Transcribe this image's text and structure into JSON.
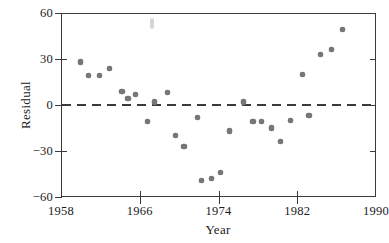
{
  "chart_data": {
    "type": "scatter",
    "title": "",
    "xlabel": "Year",
    "ylabel": "Residual",
    "xlim": [
      1958,
      1990
    ],
    "ylim": [
      -60,
      60
    ],
    "xticks": [
      1958,
      1966,
      1974,
      1982,
      1990
    ],
    "xtick_labels": [
      "1958",
      "1966",
      "1974",
      "1982",
      "1990"
    ],
    "yticks": [
      60,
      30,
      0,
      -30,
      -60
    ],
    "ytick_labels": [
      "60",
      "30",
      "0",
      "−30",
      "−60"
    ],
    "grid": false,
    "legend": null,
    "marker": "filled-circle",
    "marker_color": "#77777a",
    "reference_line": {
      "type": "horizontal-dashed",
      "y": 0,
      "color": "#3a3a3a",
      "style": "dashed"
    },
    "frame_color": "#3a3a3a",
    "background_color": "#ffffff",
    "points": [
      {
        "x": 1960.0,
        "y": 28
      },
      {
        "x": 1960.8,
        "y": 19
      },
      {
        "x": 1961.9,
        "y": 19
      },
      {
        "x": 1962.9,
        "y": 24
      },
      {
        "x": 1964.2,
        "y": 9
      },
      {
        "x": 1964.8,
        "y": 4
      },
      {
        "x": 1965.6,
        "y": 7
      },
      {
        "x": 1966.8,
        "y": -11
      },
      {
        "x": 1967.5,
        "y": 2
      },
      {
        "x": 1968.8,
        "y": 8
      },
      {
        "x": 1969.6,
        "y": -20
      },
      {
        "x": 1970.5,
        "y": -27
      },
      {
        "x": 1971.9,
        "y": -8
      },
      {
        "x": 1972.3,
        "y": -49
      },
      {
        "x": 1973.3,
        "y": -48
      },
      {
        "x": 1974.2,
        "y": -44
      },
      {
        "x": 1975.1,
        "y": -17
      },
      {
        "x": 1976.5,
        "y": 2
      },
      {
        "x": 1977.5,
        "y": -11
      },
      {
        "x": 1978.4,
        "y": -11
      },
      {
        "x": 1979.4,
        "y": -15
      },
      {
        "x": 1980.3,
        "y": -24
      },
      {
        "x": 1981.3,
        "y": -10
      },
      {
        "x": 1983.2,
        "y": -7
      },
      {
        "x": 1982.5,
        "y": 20
      },
      {
        "x": 1984.4,
        "y": 33
      },
      {
        "x": 1985.5,
        "y": 36
      },
      {
        "x": 1986.6,
        "y": 49
      }
    ]
  },
  "axes": {
    "y_title": "Residual",
    "x_title": "Year"
  }
}
